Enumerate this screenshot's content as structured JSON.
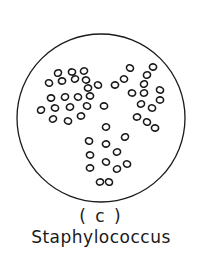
{
  "figure": {
    "panel_label": "( c )",
    "caption": "Staphylococcus",
    "field_circle": {
      "cx": 101,
      "cy": 118,
      "r": 84
    },
    "cell_color": "#1a1a1a",
    "cells": [
      [
        58,
        73
      ],
      [
        72,
        72
      ],
      [
        84,
        71
      ],
      [
        49,
        83
      ],
      [
        62,
        81
      ],
      [
        75,
        79
      ],
      [
        86,
        80
      ],
      [
        88,
        88
      ],
      [
        98,
        85
      ],
      [
        51,
        98
      ],
      [
        65,
        97
      ],
      [
        78,
        97
      ],
      [
        90,
        96
      ],
      [
        41,
        110
      ],
      [
        55,
        108
      ],
      [
        70,
        107
      ],
      [
        87,
        106
      ],
      [
        104,
        106
      ],
      [
        53,
        119
      ],
      [
        68,
        121
      ],
      [
        81,
        116
      ],
      [
        130,
        68
      ],
      [
        153,
        67
      ],
      [
        147,
        75
      ],
      [
        124,
        79
      ],
      [
        115,
        85
      ],
      [
        144,
        84
      ],
      [
        132,
        93
      ],
      [
        144,
        93
      ],
      [
        160,
        90
      ],
      [
        160,
        100
      ],
      [
        141,
        104
      ],
      [
        152,
        108
      ],
      [
        137,
        117
      ],
      [
        147,
        122
      ],
      [
        155,
        128
      ],
      [
        106,
        127
      ],
      [
        89,
        141
      ],
      [
        106,
        144
      ],
      [
        125,
        137
      ],
      [
        90,
        155
      ],
      [
        117,
        152
      ],
      [
        106,
        162
      ],
      [
        90,
        168
      ],
      [
        117,
        169
      ],
      [
        127,
        164
      ],
      [
        100,
        182
      ],
      [
        109,
        182
      ]
    ]
  }
}
